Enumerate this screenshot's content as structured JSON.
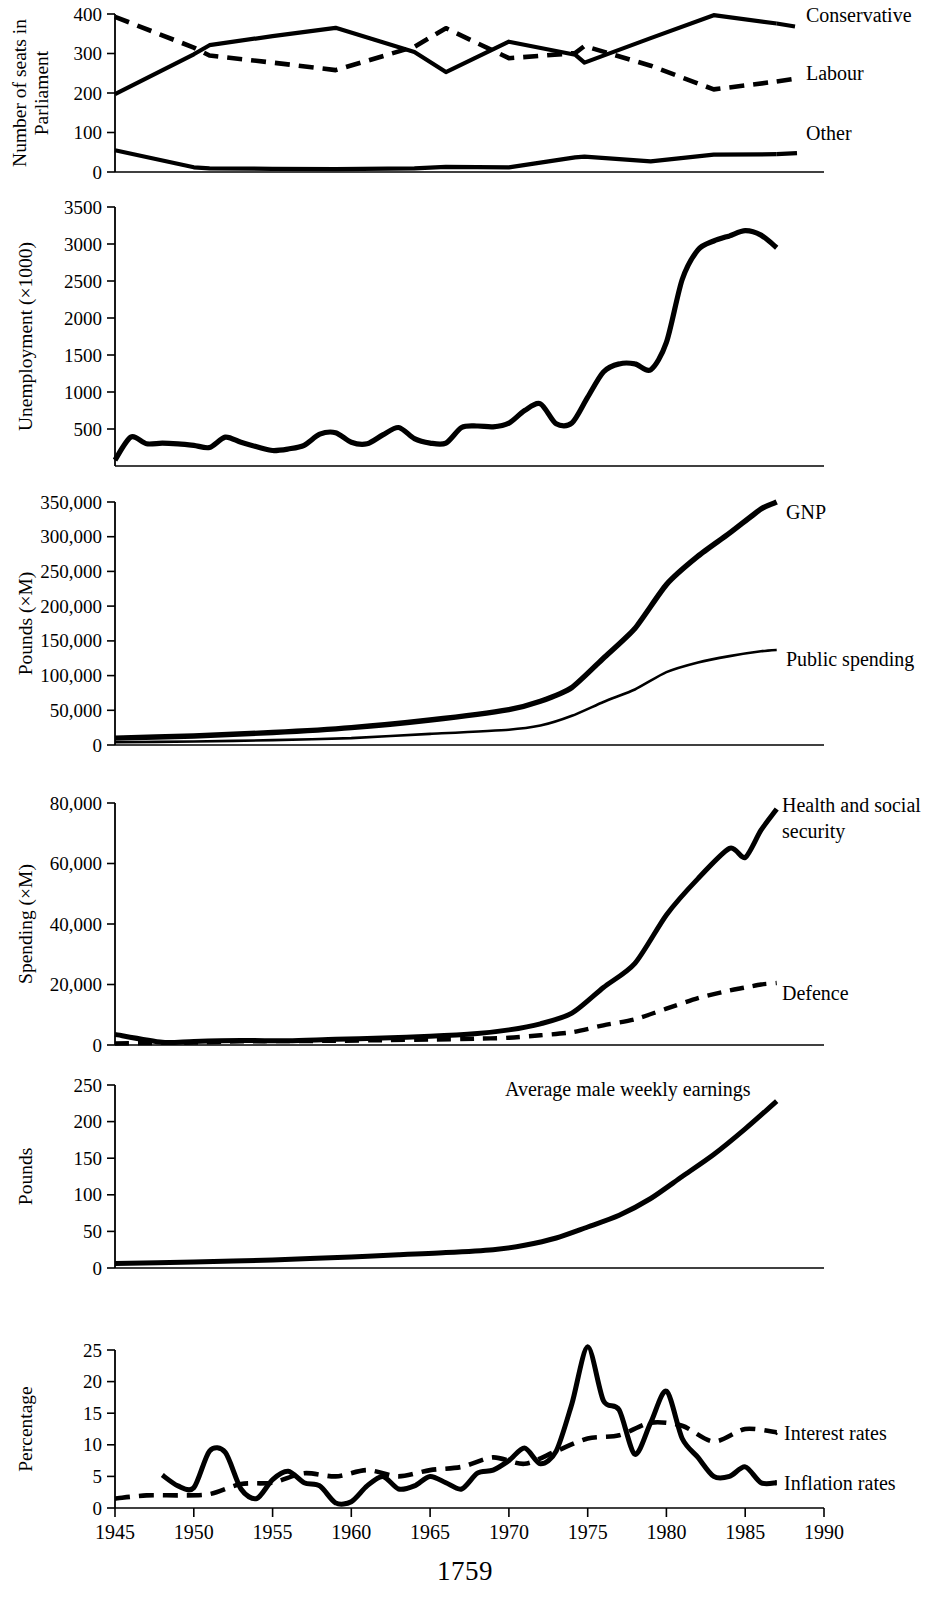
{
  "page": {
    "number": "1759",
    "width": 930,
    "height": 1603
  },
  "xaxis": {
    "label": "",
    "ticks": [
      "1945",
      "1950",
      "1955",
      "1960",
      "1965",
      "1970",
      "1975",
      "1980",
      "1985",
      "1990"
    ],
    "min": 1945,
    "max": 1990
  },
  "panels": [
    {
      "id": "parliament",
      "ylabel": "Number of seats in\nParliament",
      "ylabel_line1": "Number of seats in",
      "ylabel_line2": "Parliament",
      "yticks": [
        "0",
        "100",
        "200",
        "300",
        "400"
      ],
      "ymin": 0,
      "ymax": 400,
      "series_labels": [
        "Conservative",
        "Labour",
        "Other"
      ]
    },
    {
      "id": "unemployment",
      "ylabel": "Unemployment (×1000)",
      "yticks": [
        "500",
        "1000",
        "1500",
        "2000",
        "2500",
        "3000",
        "3500"
      ],
      "ymin": 0,
      "ymax": 3500,
      "series_labels": []
    },
    {
      "id": "pounds",
      "ylabel": "Pounds (×M)",
      "yticks": [
        "0",
        "50,000",
        "100,000",
        "150,000",
        "200,000",
        "250,000",
        "300,000",
        "350,000"
      ],
      "ymin": 0,
      "ymax": 350000,
      "series_labels": [
        "GNP",
        "Public spending"
      ]
    },
    {
      "id": "spending",
      "ylabel": "Spending (×M)",
      "yticks": [
        "0",
        "20,000",
        "40,000",
        "60,000",
        "80,000"
      ],
      "ymin": 0,
      "ymax": 80000,
      "series_labels": [
        "Health and social",
        "security",
        "Defence"
      ]
    },
    {
      "id": "earnings",
      "ylabel": "Pounds",
      "yticks": [
        "0",
        "50",
        "100",
        "150",
        "200",
        "250"
      ],
      "ymin": 0,
      "ymax": 250,
      "series_labels": [
        "Average male weekly earnings"
      ]
    },
    {
      "id": "percentage",
      "ylabel": "Percentage",
      "yticks": [
        "0",
        "5",
        "10",
        "15",
        "20",
        "25"
      ],
      "ymin": 0,
      "ymax": 25,
      "series_labels": [
        "Interest rates",
        "Inflation rates"
      ]
    }
  ],
  "chart_data": [
    {
      "type": "line",
      "title": "Number of seats in Parliament",
      "xlabel": "",
      "ylabel": "Number of seats in Parliament",
      "ylim": [
        0,
        400
      ],
      "xlim": [
        1945,
        1990
      ],
      "grid": false,
      "legend": "right-inline",
      "x": [
        1945,
        1950,
        1951,
        1955,
        1959,
        1964,
        1966,
        1970,
        1974.2,
        1974.8,
        1979,
        1983,
        1987
      ],
      "series": [
        {
          "name": "Conservative",
          "style": "solid",
          "values": [
            197,
            298,
            321,
            344,
            365,
            304,
            253,
            330,
            297,
            277,
            339,
            397,
            376
          ]
        },
        {
          "name": "Labour",
          "style": "dashed",
          "values": [
            393,
            315,
            295,
            277,
            258,
            317,
            364,
            288,
            301,
            319,
            269,
            209,
            229
          ]
        },
        {
          "name": "Other",
          "style": "solid",
          "values": [
            55,
            12,
            9,
            8,
            7,
            9,
            13,
            12,
            37,
            39,
            27,
            44,
            45
          ]
        }
      ]
    },
    {
      "type": "line",
      "title": "Unemployment (×1000)",
      "xlabel": "",
      "ylabel": "Unemployment (×1000)",
      "ylim": [
        0,
        3500
      ],
      "xlim": [
        1945,
        1990
      ],
      "grid": false,
      "x": [
        1945,
        1946,
        1947,
        1948,
        1949,
        1950,
        1951,
        1952,
        1953,
        1954,
        1955,
        1956,
        1957,
        1958,
        1959,
        1960,
        1961,
        1962,
        1963,
        1964,
        1965,
        1966,
        1967,
        1968,
        1969,
        1970,
        1971,
        1972,
        1973,
        1974,
        1975,
        1976,
        1977,
        1978,
        1979,
        1980,
        1981,
        1982,
        1983,
        1984,
        1985,
        1986,
        1987
      ],
      "series": [
        {
          "name": "Unemployment",
          "style": "solid",
          "values": [
            80,
            390,
            300,
            310,
            300,
            280,
            250,
            390,
            320,
            260,
            210,
            230,
            280,
            430,
            450,
            320,
            300,
            420,
            520,
            370,
            310,
            310,
            520,
            540,
            530,
            580,
            750,
            840,
            570,
            580,
            930,
            1270,
            1380,
            1380,
            1300,
            1670,
            2520,
            2920,
            3040,
            3110,
            3180,
            3120,
            2950
          ]
        }
      ]
    },
    {
      "type": "line",
      "title": "Pounds (×M)",
      "xlabel": "",
      "ylabel": "Pounds (×M)",
      "ylim": [
        0,
        350000
      ],
      "xlim": [
        1945,
        1990
      ],
      "grid": false,
      "x": [
        1945,
        1950,
        1955,
        1960,
        1965,
        1970,
        1972,
        1974,
        1976,
        1978,
        1980,
        1982,
        1984,
        1986,
        1987
      ],
      "series": [
        {
          "name": "GNP",
          "style": "solid-thick",
          "values": [
            10000,
            13000,
            18000,
            25000,
            36000,
            51000,
            63000,
            83000,
            125000,
            168000,
            231000,
            272000,
            305000,
            340000,
            350000
          ]
        },
        {
          "name": "Public spending",
          "style": "solid-thin",
          "values": [
            4000,
            5000,
            7000,
            10000,
            16000,
            22000,
            28000,
            42000,
            62000,
            80000,
            105000,
            119000,
            128000,
            135000,
            137000
          ]
        }
      ]
    },
    {
      "type": "line",
      "title": "Spending (×M)",
      "xlabel": "",
      "ylabel": "Spending (×M)",
      "ylim": [
        0,
        80000
      ],
      "xlim": [
        1945,
        1990
      ],
      "grid": false,
      "x": [
        1945,
        1948,
        1950,
        1953,
        1956,
        1959,
        1962,
        1965,
        1968,
        1970,
        1972,
        1974,
        1976,
        1978,
        1980,
        1982,
        1984,
        1985,
        1986,
        1987
      ],
      "series": [
        {
          "name": "Health and social security",
          "style": "solid",
          "values": [
            3500,
            900,
            1200,
            1500,
            1400,
            1900,
            2300,
            2900,
            3800,
            5000,
            7000,
            10500,
            19000,
            27000,
            43000,
            55000,
            65000,
            62000,
            71000,
            78000
          ]
        },
        {
          "name": "Defence",
          "style": "dashed",
          "values": [
            500,
            700,
            800,
            1200,
            1300,
            1400,
            1600,
            1800,
            2100,
            2400,
            3200,
            4200,
            6500,
            8500,
            12000,
            15500,
            18000,
            19000,
            20000,
            20500
          ]
        }
      ]
    },
    {
      "type": "line",
      "title": "Average male weekly earnings",
      "xlabel": "",
      "ylabel": "Pounds",
      "ylim": [
        0,
        250
      ],
      "xlim": [
        1945,
        1990
      ],
      "grid": false,
      "x": [
        1945,
        1950,
        1955,
        1960,
        1963,
        1966,
        1969,
        1971,
        1973,
        1975,
        1977,
        1979,
        1981,
        1983,
        1985,
        1987
      ],
      "series": [
        {
          "name": "Average male weekly earnings",
          "style": "solid",
          "values": [
            6,
            8,
            11,
            15,
            18,
            21,
            25,
            31,
            41,
            56,
            72,
            95,
            125,
            155,
            190,
            228
          ]
        }
      ]
    },
    {
      "type": "line",
      "title": "Percentage",
      "xlabel": "",
      "ylabel": "Percentage",
      "ylim": [
        0,
        25
      ],
      "xlim": [
        1945,
        1990
      ],
      "grid": false,
      "series": [
        {
          "name": "Interest rates",
          "style": "dashed",
          "x": [
            1945,
            1947,
            1949,
            1951,
            1953,
            1955,
            1957,
            1959,
            1961,
            1963,
            1965,
            1967,
            1969,
            1971,
            1973,
            1975,
            1977,
            1979,
            1981,
            1983,
            1985,
            1987
          ],
          "values": [
            1.5,
            2.0,
            2.0,
            2.2,
            3.8,
            4.0,
            5.5,
            5.0,
            6.0,
            5.0,
            6.0,
            6.5,
            8.0,
            7.0,
            9.0,
            11.0,
            11.5,
            13.5,
            13.0,
            10.5,
            12.5,
            12.0
          ]
        },
        {
          "name": "Inflation rates",
          "style": "solid",
          "x": [
            1948,
            1949,
            1950,
            1951,
            1952,
            1953,
            1954,
            1955,
            1956,
            1957,
            1958,
            1959,
            1960,
            1961,
            1962,
            1963,
            1964,
            1965,
            1966,
            1967,
            1968,
            1969,
            1970,
            1971,
            1972,
            1973,
            1974,
            1975,
            1976,
            1977,
            1978,
            1979,
            1980,
            1981,
            1982,
            1983,
            1984,
            1985,
            1986,
            1987
          ],
          "values": [
            5.2,
            3.5,
            3.2,
            9.0,
            8.8,
            3.0,
            1.5,
            4.5,
            5.8,
            4.0,
            3.5,
            0.8,
            1.0,
            3.5,
            5.0,
            3.0,
            3.5,
            5.0,
            4.0,
            3.0,
            5.5,
            6.0,
            7.5,
            9.5,
            7.0,
            9.0,
            16.5,
            25.5,
            17.0,
            15.5,
            8.5,
            13.5,
            18.5,
            11.0,
            8.0,
            5.0,
            5.0,
            6.5,
            4.0,
            4.0
          ]
        }
      ]
    }
  ]
}
